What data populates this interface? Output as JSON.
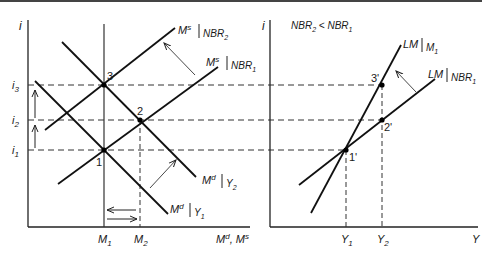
{
  "figure": {
    "left_panel": {
      "y_axis_label": "i",
      "x_axis_label_main": "M",
      "x_axis_label_sup1": "d",
      "x_axis_label_sep": ", M",
      "x_axis_label_sup2": "s",
      "y_ticks": [
        {
          "label": "i",
          "sub": "3",
          "y": 85
        },
        {
          "label": "i",
          "sub": "2",
          "y": 120
        },
        {
          "label": "i",
          "sub": "1",
          "y": 150
        }
      ],
      "x_ticks": [
        {
          "label": "M",
          "sub": "1",
          "x": 104
        },
        {
          "label": "M",
          "sub": "2",
          "x": 140
        }
      ],
      "points": [
        {
          "label": "1",
          "x": 104,
          "y": 150
        },
        {
          "label": "2",
          "x": 140,
          "y": 120
        },
        {
          "label": "3",
          "x": 104,
          "y": 85
        }
      ],
      "curves": {
        "ms_nbr2": {
          "main": "M",
          "sup": "s",
          "cond": "NBR",
          "sub": "2"
        },
        "ms_nbr1": {
          "main": "M",
          "sup": "s",
          "cond": "NBR",
          "sub": "1"
        },
        "md_y2": {
          "main": "M",
          "sup": "d",
          "cond": "Y",
          "sub": "2"
        },
        "md_y1": {
          "main": "M",
          "sup": "d",
          "cond": "Y",
          "sub": "1"
        }
      }
    },
    "right_panel": {
      "y_axis_label": "i",
      "x_axis_label": "Y",
      "condition": {
        "a": "NBR",
        "a_sub": "2",
        "op": " < ",
        "b": "NBR",
        "b_sub": "1"
      },
      "x_ticks": [
        {
          "label": "Y",
          "sub": "1",
          "x": 346
        },
        {
          "label": "Y",
          "sub": "2",
          "x": 382
        }
      ],
      "points": [
        {
          "label": "1'",
          "x": 346,
          "y": 150
        },
        {
          "label": "2'",
          "x": 382,
          "y": 120
        },
        {
          "label": "3'",
          "x": 382,
          "y": 85
        }
      ],
      "curves": {
        "lm_m1": {
          "main": "LM",
          "cond": "M",
          "sub": "1"
        },
        "lm_nbr1": {
          "main": "LM",
          "cond": "NBR",
          "sub": "1"
        }
      }
    }
  }
}
